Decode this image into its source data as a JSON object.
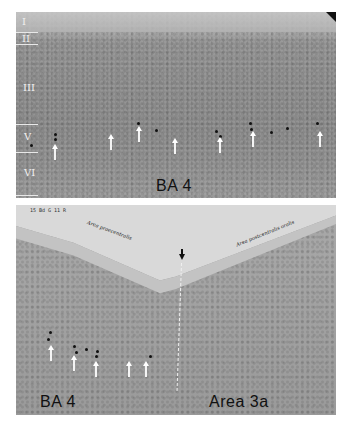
{
  "figure": {
    "panels": [
      {
        "id": "top",
        "label": "BA 4",
        "layers": [
          {
            "label": "I"
          },
          {
            "label": "II"
          },
          {
            "label": "III"
          },
          {
            "label": "V"
          },
          {
            "label": "VI"
          }
        ],
        "arrow_count": 7
      },
      {
        "id": "bottom",
        "labels": {
          "left": "BA 4",
          "right": "Area 3a"
        },
        "corner_note": "15 Bd G  11 R",
        "handwritten_left": "Area praecentralis",
        "handwritten_right": "Area postcentralis oralis",
        "arrow_count": 5
      }
    ]
  }
}
